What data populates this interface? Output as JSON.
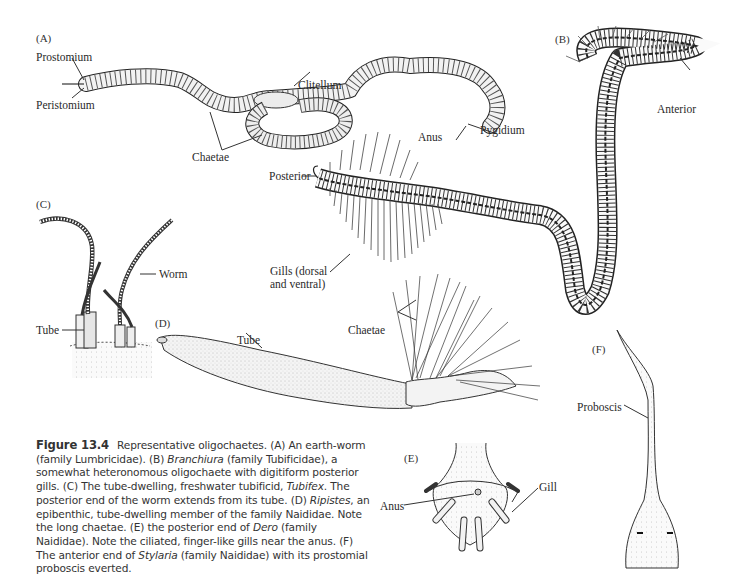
{
  "figure": {
    "number_label": "Figure 13.4",
    "caption_parts": [
      {
        "text": "Representative oligochaetes. (A) An earth-worm (family Lumbricidae). (B) ",
        "italic": false
      },
      {
        "text": "Branchiura",
        "italic": true
      },
      {
        "text": " (family Tubificidae), a somewhat heteronomous oligochaete with digitiform posterior gills. (C) The tube-dwelling, freshwater tubificid, ",
        "italic": false
      },
      {
        "text": "Tubifex",
        "italic": true
      },
      {
        "text": ". The posterior end of the worm extends from its tube. (D) ",
        "italic": false
      },
      {
        "text": "Ripistes",
        "italic": true
      },
      {
        "text": ", an epibenthic, tube-dwelling member of the family Naididae. Note the long chaetae. (E) the posterior end of ",
        "italic": false
      },
      {
        "text": "Dero",
        "italic": true
      },
      {
        "text": " (family Naididae). Note the ciliated, finger-like gills near the anus. (F) The anterior end of ",
        "italic": false
      },
      {
        "text": "Stylaria",
        "italic": true
      },
      {
        "text": " (family Naididae) with its prostomial proboscis everted.",
        "italic": false
      }
    ]
  },
  "panels": {
    "A": {
      "tag": "(A)",
      "labels": {
        "prostomium": "Prostomium",
        "peristomium": "Peristomium",
        "clitellum": "Clitellum",
        "chaetae": "Chaetae",
        "anus": "Anus",
        "pygidium": "Pygidium"
      }
    },
    "B": {
      "tag": "(B)",
      "labels": {
        "anterior": "Anterior",
        "posterior": "Posterior",
        "gills_line1": "Gills (dorsal",
        "gills_line2": "and ventral)"
      }
    },
    "C": {
      "tag": "(C)",
      "labels": {
        "worm": "Worm",
        "tube": "Tube"
      }
    },
    "D": {
      "tag": "(D)",
      "labels": {
        "tube": "Tube",
        "chaetae": "Chaetae"
      }
    },
    "E": {
      "tag": "(E)",
      "labels": {
        "anus": "Anus",
        "gill": "Gill"
      }
    },
    "F": {
      "tag": "(F)",
      "labels": {
        "proboscis": "Proboscis"
      }
    }
  }
}
